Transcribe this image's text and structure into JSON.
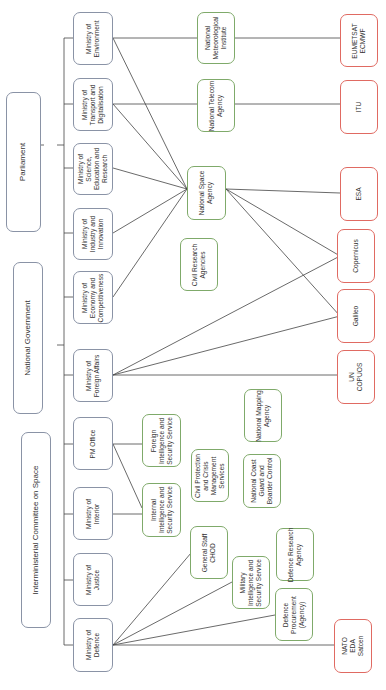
{
  "diagram": {
    "orientation": "rotated-90-ccw",
    "colors": {
      "government_border": "#8a93a6",
      "national_agency_border": "#7faa6a",
      "international_border": "#e06a62",
      "connector": "#444444"
    },
    "top_level": {
      "parliament": "Parliament",
      "national_government": "National Government",
      "interministerial_committee": "Interministerial Committee on Space"
    },
    "ministries": [
      {
        "id": "environment",
        "label": "Ministry of\nEnvironment"
      },
      {
        "id": "transport",
        "label": "Ministry of\nTransport and\nDigitalisation"
      },
      {
        "id": "science",
        "label": "Ministry of\nScience,\nEducation and\nResearch"
      },
      {
        "id": "industry",
        "label": "Ministry of\nIndustry and\nInnovation"
      },
      {
        "id": "economy",
        "label": "Ministry of\nEconomy and\nCompetitiveness"
      },
      {
        "id": "foreign",
        "label": "Ministry of\nForeign Affairs"
      },
      {
        "id": "pm",
        "label": "PM Office"
      },
      {
        "id": "interior",
        "label": "Ministry of\nInterior"
      },
      {
        "id": "justice",
        "label": "Ministry of\nJustice"
      },
      {
        "id": "defence",
        "label": "Ministry of\nDefence"
      }
    ],
    "national_agencies": [
      {
        "id": "met",
        "label": "National\nMeteorological\nInstitute"
      },
      {
        "id": "telecom",
        "label": "National Telecom\nAgency"
      },
      {
        "id": "space",
        "label": "National Space\nAgency"
      },
      {
        "id": "civil_research",
        "label": "Civil Research\nAgencies"
      },
      {
        "id": "mapping",
        "label": "National Mapping\nAgency"
      },
      {
        "id": "foreign_intel",
        "label": "Foreign\nIntelligence and\nSecurity Service"
      },
      {
        "id": "civil_protection",
        "label": "Civil Protection\nand Crisis\nManagement\nServices"
      },
      {
        "id": "coast_guard",
        "label": "National Coast\nGuard and\nBoarder Control"
      },
      {
        "id": "internal_intel",
        "label": "Internal\nIntelligence and\nSecurity Service"
      },
      {
        "id": "general_staff",
        "label": "General Staff\nCHOD"
      },
      {
        "id": "military_intel",
        "label": "Military\nIntelligence and\nSecurity Service"
      },
      {
        "id": "defence_research",
        "label": "Defence Research\nAgency"
      },
      {
        "id": "defence_procurement",
        "label": "Defence\nProcurement\n(Agency)"
      }
    ],
    "international": [
      {
        "id": "eumetsat",
        "label": "EUMETSAT\nECMWF"
      },
      {
        "id": "itu",
        "label": "ITU"
      },
      {
        "id": "esa",
        "label": "ESA"
      },
      {
        "id": "copernicus",
        "label": "Copernicus"
      },
      {
        "id": "galileo",
        "label": "Galileo"
      },
      {
        "id": "copuos",
        "label": "UN\nCOPUOS"
      },
      {
        "id": "nato",
        "label": "NATO\nEDA\nSatcen"
      }
    ],
    "connections": [
      [
        "environment",
        "met"
      ],
      [
        "environment",
        "space"
      ],
      [
        "transport",
        "telecom"
      ],
      [
        "transport",
        "space"
      ],
      [
        "science",
        "space"
      ],
      [
        "industry",
        "space"
      ],
      [
        "economy",
        "space"
      ],
      [
        "foreign",
        "copernicus"
      ],
      [
        "foreign",
        "galileo"
      ],
      [
        "foreign",
        "copuos"
      ],
      [
        "met",
        "eumetsat"
      ],
      [
        "telecom",
        "itu"
      ],
      [
        "space",
        "esa"
      ],
      [
        "space",
        "copernicus"
      ],
      [
        "space",
        "galileo"
      ],
      [
        "pm",
        "foreign_intel"
      ],
      [
        "pm",
        "internal_intel"
      ],
      [
        "interior",
        "internal_intel"
      ],
      [
        "defence",
        "general_staff"
      ],
      [
        "defence",
        "military_intel"
      ],
      [
        "defence",
        "defence_procurement"
      ],
      [
        "defence",
        "nato"
      ]
    ]
  }
}
